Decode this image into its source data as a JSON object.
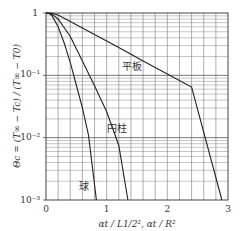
{
  "chart_data": {
    "type": "line",
    "title": "",
    "xlabel": "αt / L1/2², αt / R²",
    "ylabel": "Θc = (T∞ − Tc) / (T∞ − T0)",
    "xlim": [
      0,
      3
    ],
    "ylim": [
      0.001,
      1
    ],
    "yscale": "log",
    "grid": true,
    "x_ticks": [
      "0",
      "1",
      "2",
      "3"
    ],
    "y_ticks": [
      "1",
      "10⁻¹",
      "10⁻²",
      "10⁻³"
    ],
    "legend": "inline labels",
    "series": [
      {
        "name": "平板",
        "x": [
          0,
          0.05,
          0.1,
          0.2,
          0.4,
          0.8,
          1.2,
          1.6,
          2.0,
          2.4,
          2.9
        ],
        "y": [
          1.0,
          0.998,
          0.987,
          0.93,
          0.73,
          0.45,
          0.28,
          0.17,
          0.105,
          0.065,
          0.001
        ]
      },
      {
        "name": "円柱",
        "x": [
          0,
          0.05,
          0.1,
          0.2,
          0.4,
          0.6,
          0.8,
          1.0,
          1.2,
          1.35
        ],
        "y": [
          1.0,
          0.99,
          0.95,
          0.8,
          0.42,
          0.17,
          0.068,
          0.026,
          0.0075,
          0.001
        ]
      },
      {
        "name": "球",
        "x": [
          0,
          0.05,
          0.1,
          0.2,
          0.3,
          0.4,
          0.5,
          0.6,
          0.7,
          0.83
        ],
        "y": [
          1.0,
          0.98,
          0.9,
          0.6,
          0.33,
          0.16,
          0.07,
          0.03,
          0.011,
          0.001
        ]
      }
    ]
  },
  "labels": {
    "plate": "平板",
    "cylinder": "円柱",
    "sphere": "球",
    "x_axis_title": "αt / L1/2², αt / R²",
    "y_axis_title": "Θc = (T∞ − Tc) / (T∞ − T0)",
    "x_ticks": [
      "0",
      "1",
      "2",
      "3"
    ],
    "y_ticks": [
      "1",
      "10⁻¹",
      "10⁻²",
      "10⁻³"
    ]
  }
}
